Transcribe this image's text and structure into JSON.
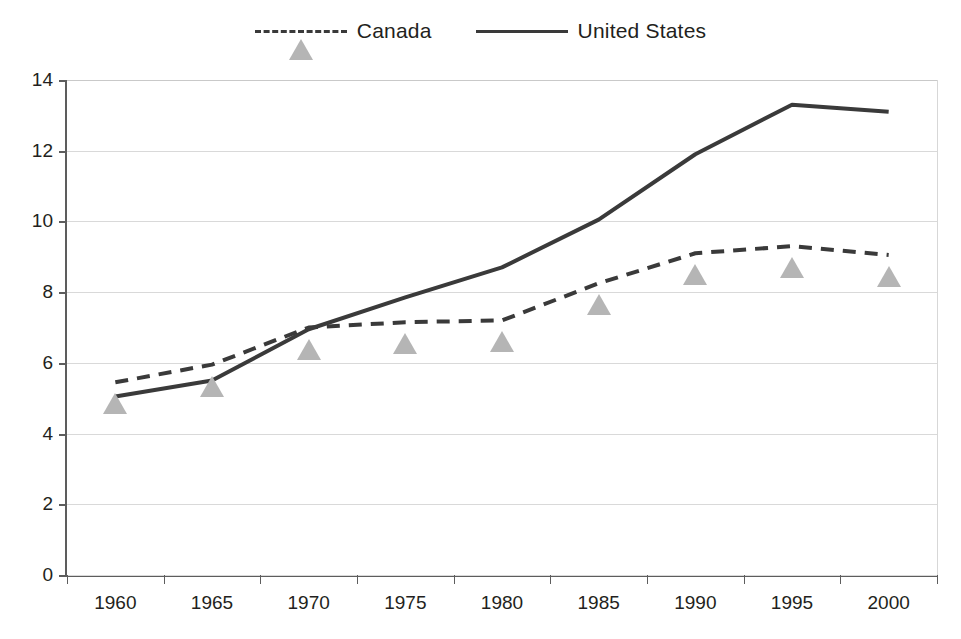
{
  "legend": {
    "position": "top-center",
    "entries": [
      {
        "label": "Canada",
        "marker": "triangle-icon",
        "line_style": "dashed",
        "color": "#b5b5b5",
        "line_color": "#3a3a3a"
      },
      {
        "label": "United States",
        "marker": "square-icon",
        "line_style": "solid",
        "color": "#3b3b3b",
        "line_color": "#3a3a3a"
      }
    ]
  },
  "axes": {
    "y_ticks": [
      "14",
      "12",
      "10",
      "8",
      "6",
      "4",
      "2",
      "0"
    ],
    "x_ticks": [
      "1960",
      "1965",
      "1970",
      "1975",
      "1980",
      "1985",
      "1990",
      "1995",
      "2000"
    ]
  },
  "chart_data": {
    "type": "line",
    "title": "",
    "subtitle": "",
    "xlabel": "",
    "ylabel": "",
    "categories": [
      "1960",
      "1965",
      "1970",
      "1975",
      "1980",
      "1985",
      "1990",
      "1995",
      "2000"
    ],
    "x": [
      1960,
      1965,
      1970,
      1975,
      1980,
      1985,
      1990,
      1995,
      2000
    ],
    "ylim": [
      0,
      14
    ],
    "ytick_step": 2,
    "grid": true,
    "legend_position": "top-center",
    "series": [
      {
        "name": "Canada",
        "marker": "triangle",
        "line_style": "dashed",
        "color": "#b5b5b5",
        "values": [
          5.45,
          5.95,
          7.0,
          7.15,
          7.2,
          8.25,
          9.1,
          9.3,
          9.05
        ]
      },
      {
        "name": "United States",
        "marker": "square",
        "line_style": "solid",
        "color": "#3b3b3b",
        "values": [
          5.05,
          5.5,
          6.95,
          7.85,
          8.7,
          10.05,
          11.9,
          13.3,
          13.1
        ]
      }
    ]
  }
}
